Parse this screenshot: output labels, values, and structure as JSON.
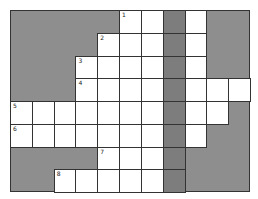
{
  "puzzle": {
    "rows": 8,
    "cols": 11,
    "colors": {
      "block": "#8e8e8e",
      "shaded_column": "#7d7d7d",
      "cell": "#ffffff",
      "border": "#333333"
    },
    "layout": [
      "BBBBBWWSWBB",
      "BBBBWWWSWBB",
      "BBBWWWWSWBB",
      "BBBWWWWSWWW",
      "WWWWWWWSWWB",
      "WWWWWWWSWBB",
      "BBBBWWWSBBB",
      "BBWWWWWSBBB"
    ],
    "numbers": [
      {
        "row": 0,
        "col": 5,
        "label": "1"
      },
      {
        "row": 1,
        "col": 4,
        "label": "2"
      },
      {
        "row": 2,
        "col": 3,
        "label": "3"
      },
      {
        "row": 3,
        "col": 3,
        "label": "4"
      },
      {
        "row": 4,
        "col": 0,
        "label": "5"
      },
      {
        "row": 5,
        "col": 0,
        "label": "6"
      },
      {
        "row": 6,
        "col": 4,
        "label": "7"
      },
      {
        "row": 7,
        "col": 2,
        "label": "8"
      }
    ]
  }
}
